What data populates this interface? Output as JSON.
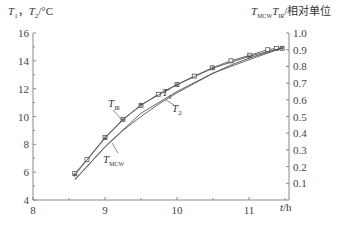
{
  "chart_data": {
    "type": "line",
    "title": "",
    "xlabel": "t/h",
    "ylabel_left": "T1, T2/°C",
    "ylabel_right": "TMCW,TIR/相对单位",
    "xlim": [
      8,
      11.55
    ],
    "ylim_left": [
      4,
      16
    ],
    "ylim_right": [
      0,
      1.0
    ],
    "x_ticks": [
      "8",
      "9",
      "10",
      "11"
    ],
    "y_ticks_left": [
      "4",
      "6",
      "8",
      "10",
      "12",
      "14",
      "16"
    ],
    "y_ticks_right": [
      "0.1",
      "0.2",
      "0.3",
      "0.4",
      "0.5",
      "0.6",
      "0.7",
      "0.8",
      "0.9",
      "1.0"
    ],
    "grid": false,
    "series": [
      {
        "name": "T1",
        "marker": "square",
        "x": [
          8.58,
          8.75,
          9.0,
          9.25,
          9.5,
          9.74,
          10.0,
          10.24,
          10.49,
          10.75,
          11.01,
          11.26,
          11.38,
          11.46
        ],
        "values": [
          5.9,
          6.9,
          8.5,
          9.8,
          10.8,
          11.6,
          12.3,
          12.9,
          13.5,
          14.0,
          14.4,
          14.8,
          14.9,
          14.9
        ]
      },
      {
        "name": "T2",
        "marker": "none",
        "x": [
          8.58,
          8.75,
          9.0,
          9.25,
          9.5,
          9.75,
          10.0,
          10.25,
          10.5,
          10.75,
          11.0,
          11.25,
          11.46
        ],
        "values": [
          5.5,
          6.4,
          7.8,
          9.0,
          10.0,
          10.9,
          11.7,
          12.4,
          13.1,
          13.7,
          14.2,
          14.6,
          14.9
        ]
      },
      {
        "name": "TIR",
        "marker": "plus",
        "x": [
          8.58,
          9.0,
          9.25,
          9.5,
          10.0,
          10.5,
          11.0,
          11.46
        ],
        "values_right": [
          0.15,
          0.37,
          0.48,
          0.57,
          0.69,
          0.79,
          0.86,
          0.91
        ]
      },
      {
        "name": "TMCW",
        "marker": "none",
        "x": [
          8.58,
          9.0,
          9.25,
          9.5,
          10.0,
          10.5,
          11.0,
          11.46
        ],
        "values_right": [
          0.12,
          0.32,
          0.42,
          0.52,
          0.65,
          0.76,
          0.84,
          0.91
        ]
      }
    ],
    "annotations": [
      "T1",
      "T2",
      "TIR",
      "TMCW"
    ]
  },
  "labels": {
    "left_axis_title_a": "T",
    "left_axis_title_a_sub": "1",
    "left_axis_title_sep": "，",
    "left_axis_title_b": "T",
    "left_axis_title_b_sub": "2",
    "left_axis_title_unit": "/°C",
    "right_axis_title_a": "T",
    "right_axis_title_a_sub": "MCW",
    "right_axis_title_b": "T",
    "right_axis_title_b_sub": "IR",
    "right_axis_title_unit": "/相对单位",
    "x_axis_title_var": "t",
    "x_axis_title_unit": "/h",
    "ann_t1": "T",
    "ann_t1_sub": "1",
    "ann_t2": "T",
    "ann_t2_sub": "2",
    "ann_tir": "T",
    "ann_tir_sub": "IR",
    "ann_tmcw": "T",
    "ann_tmcw_sub": "MCW"
  }
}
